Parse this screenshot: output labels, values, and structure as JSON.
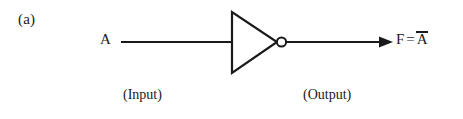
{
  "figure": {
    "part_label": "(a)",
    "background_color": "#ffffff",
    "ink_color": "#1a1a1a"
  },
  "labels": {
    "input_signal": "A",
    "output_signal_name": "F",
    "equals": "=",
    "output_expression_term": "A",
    "output_expression_overbar": true,
    "input_caption": "(Input)",
    "output_caption": "(Output)"
  },
  "diagram": {
    "type": "logic-gate-schematic",
    "gate": "NOT",
    "gate_symbol": "inverter-triangle-with-bubble",
    "wires": [
      {
        "name": "input-wire",
        "from_x": 121,
        "to_x": 232,
        "y": 42
      },
      {
        "name": "output-wire",
        "from_x": 286,
        "to_x": 392,
        "y": 42
      }
    ],
    "triangle": {
      "left_x": 231,
      "top_y": 12,
      "bottom_y": 73,
      "apex_x": 277,
      "apex_y": 42
    },
    "bubble": {
      "cx": 281.5,
      "cy": 42,
      "r": 5
    },
    "arrowhead": {
      "tip_x": 393,
      "y": 42,
      "length": 13,
      "half_height": 5
    }
  }
}
